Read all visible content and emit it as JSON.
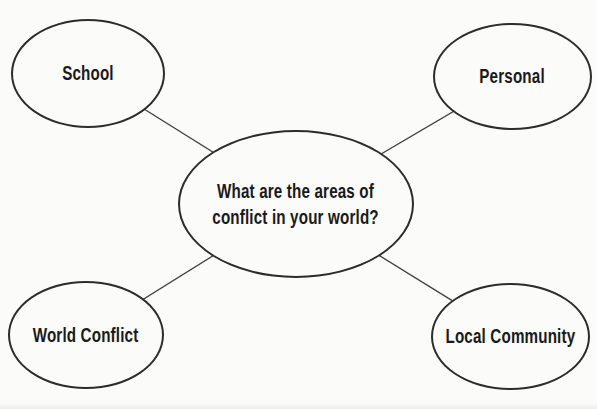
{
  "colors": {
    "background": "#fbfbf9",
    "ellipse_stroke": "#2c2c2c",
    "connector": "#3f3f3f",
    "text": "#1a1a1a"
  },
  "center_node": {
    "label": "What are the areas of conflict in your world?",
    "lines": [
      "What are the areas of",
      "conflict in your world?"
    ]
  },
  "nodes": [
    {
      "id": "school",
      "label": "School"
    },
    {
      "id": "personal",
      "label": "Personal"
    },
    {
      "id": "world-conflict",
      "label": "World Conflict"
    },
    {
      "id": "local-community",
      "label": "Local Community"
    }
  ]
}
